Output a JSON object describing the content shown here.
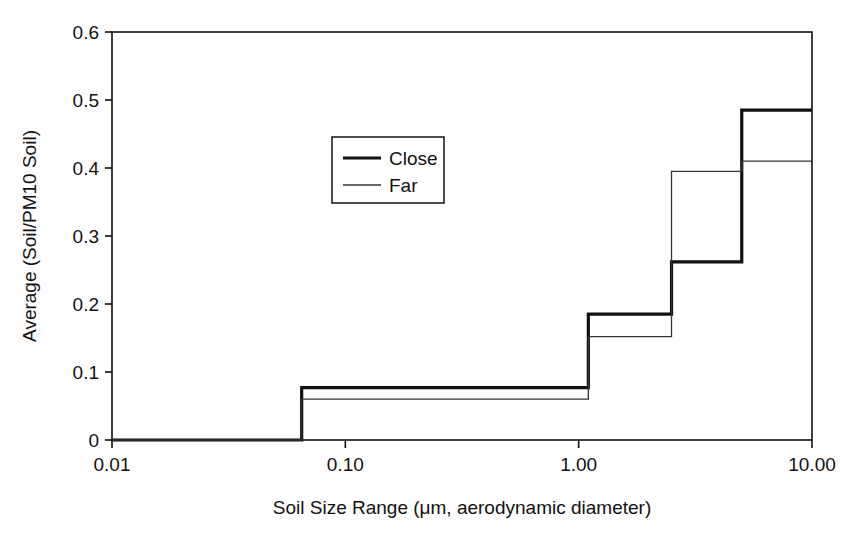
{
  "chart_data": {
    "type": "line",
    "title": "",
    "subtitle": "",
    "xlabel": "Soil Size Range (μm, aerodynamic diameter)",
    "ylabel": "Average (Soil/PM10 Soil)",
    "xscale": "log",
    "yscale": "linear",
    "xlim": [
      0.01,
      10.0
    ],
    "ylim": [
      0,
      0.6
    ],
    "grid": false,
    "legend_position": "upper-center-left",
    "xtick_labels": [
      "0.01",
      "0.10",
      "1.00",
      "10.00"
    ],
    "xtick_values": [
      0.01,
      0.1,
      1.0,
      10.0
    ],
    "ytick_labels": [
      "0",
      "0.1",
      "0.2",
      "0.3",
      "0.4",
      "0.5",
      "0.6"
    ],
    "ytick_values": [
      0,
      0.1,
      0.2,
      0.3,
      0.4,
      0.5,
      0.6
    ],
    "bin_edges": [
      0.01,
      0.065,
      1.1,
      2.5,
      5.0,
      10.0
    ],
    "bin_labels": [
      "0.01-0.065",
      "0.065-1.1",
      "1.1-2.5",
      "2.5-5.0",
      "5.0-10.0"
    ],
    "series": [
      {
        "name": "Close",
        "style": "thick",
        "color": "#111111",
        "linewidth": 3.2,
        "values": [
          0.0,
          0.077,
          0.185,
          0.262,
          0.485
        ]
      },
      {
        "name": "Far",
        "style": "thin",
        "color": "#333333",
        "linewidth": 1.3,
        "values": [
          0.0,
          0.06,
          0.152,
          0.395,
          0.41
        ]
      }
    ],
    "annotations": []
  },
  "legend": {
    "entries": [
      {
        "label": "Close"
      },
      {
        "label": "Far"
      }
    ]
  },
  "colors": {
    "axis": "#111111",
    "close": "#111111",
    "far": "#333333",
    "background": "#ffffff"
  }
}
